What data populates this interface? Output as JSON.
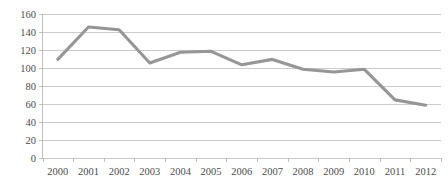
{
  "chart_data": {
    "type": "line",
    "title": "",
    "subtitle": "",
    "xlabel": "",
    "ylabel": "",
    "categories": [
      "2000",
      "2001",
      "2002",
      "2003",
      "2004",
      "2005",
      "2006",
      "2007",
      "2008",
      "2009",
      "2010",
      "2011",
      "2012"
    ],
    "values": [
      109,
      145,
      142,
      105,
      117,
      118,
      103,
      109,
      98,
      95,
      98,
      64,
      58
    ],
    "series": [
      {
        "name": "",
        "values": [
          109,
          145,
          142,
          105,
          117,
          118,
          103,
          109,
          98,
          95,
          98,
          64,
          58
        ]
      }
    ],
    "ylim": [
      0,
      160
    ],
    "y_ticks": [
      0,
      20,
      40,
      60,
      80,
      100,
      120,
      140,
      160
    ],
    "y_tick_labels": [
      "0",
      "20",
      "40",
      "60",
      "80",
      "100",
      "120",
      "140",
      "160"
    ],
    "x_tick_labels": [
      "2000",
      "2001",
      "2002",
      "2003",
      "2004",
      "2005",
      "2006",
      "2007",
      "2008",
      "2009",
      "2010",
      "2011",
      "2012"
    ],
    "grid": true,
    "grid_axis": "y",
    "legend": false,
    "legend_position": "none",
    "colors": {
      "line": "#969696",
      "gridline": "#b7b7b7",
      "axis": "#b0b0b0",
      "tick_text": "#4d4d4d",
      "background": "#ffffff"
    }
  }
}
